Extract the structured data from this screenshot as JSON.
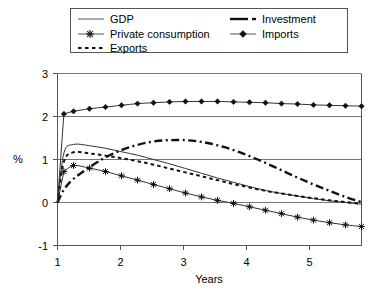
{
  "chart_data": {
    "type": "line",
    "title": "",
    "xlabel": "Years",
    "ylabel": "%",
    "xlim": [
      1,
      5.75
    ],
    "ylim": [
      -1,
      3
    ],
    "xticks": [
      1,
      2,
      3,
      4,
      5
    ],
    "yticks": [
      -1,
      0,
      1,
      2,
      3
    ],
    "xtick_labels": [
      "1",
      "2",
      "3",
      "4",
      "5"
    ],
    "ytick_labels": [
      "-1",
      "0",
      "1",
      "2",
      "3"
    ],
    "grid": "horizontal",
    "legend_position": "top",
    "x": [
      1.0,
      1.1,
      1.25,
      1.5,
      1.75,
      2.0,
      2.25,
      2.5,
      2.75,
      3.0,
      3.25,
      3.5,
      3.75,
      4.0,
      4.25,
      4.5,
      4.75,
      5.0,
      5.25,
      5.5,
      5.75
    ],
    "series": [
      {
        "name": "GDP",
        "style": "solid",
        "marker": "none",
        "color": "#333333",
        "values": [
          0.0,
          1.15,
          1.35,
          1.32,
          1.26,
          1.18,
          1.1,
          1.0,
          0.9,
          0.79,
          0.68,
          0.57,
          0.47,
          0.37,
          0.28,
          0.21,
          0.15,
          0.09,
          0.04,
          0.0,
          -0.04
        ]
      },
      {
        "name": "Private consumption",
        "style": "solid",
        "marker": "asterisk",
        "color": "#333333",
        "values": [
          0.0,
          0.72,
          0.86,
          0.8,
          0.72,
          0.62,
          0.52,
          0.42,
          0.32,
          0.22,
          0.13,
          0.05,
          -0.02,
          -0.1,
          -0.18,
          -0.26,
          -0.34,
          -0.41,
          -0.47,
          -0.52,
          -0.56
        ]
      },
      {
        "name": "Exports",
        "style": "dotted",
        "marker": "none",
        "color": "#111111",
        "values": [
          0.0,
          0.95,
          1.17,
          1.14,
          1.09,
          1.03,
          0.96,
          0.88,
          0.79,
          0.7,
          0.61,
          0.52,
          0.43,
          0.35,
          0.27,
          0.21,
          0.15,
          0.1,
          0.05,
          0.01,
          -0.03
        ]
      },
      {
        "name": "Investment",
        "style": "dashdot",
        "marker": "none",
        "color": "#111111",
        "values": [
          0.0,
          0.3,
          0.55,
          0.82,
          1.05,
          1.22,
          1.34,
          1.42,
          1.45,
          1.45,
          1.41,
          1.33,
          1.22,
          1.08,
          0.92,
          0.75,
          0.58,
          0.42,
          0.27,
          0.13,
          0.01
        ]
      },
      {
        "name": "Imports",
        "style": "solid",
        "marker": "diamond",
        "color": "#333333",
        "values": [
          0.0,
          2.06,
          2.12,
          2.18,
          2.22,
          2.26,
          2.3,
          2.32,
          2.34,
          2.35,
          2.35,
          2.35,
          2.34,
          2.33,
          2.32,
          2.3,
          2.29,
          2.27,
          2.26,
          2.25,
          2.24
        ]
      }
    ]
  },
  "legend": {
    "items": [
      {
        "label": "GDP",
        "key": "gdp"
      },
      {
        "label": "Investment",
        "key": "investment"
      },
      {
        "label": "Private consumption",
        "key": "private-consumption"
      },
      {
        "label": "Imports",
        "key": "imports"
      },
      {
        "label": "Exports",
        "key": "exports"
      }
    ]
  }
}
